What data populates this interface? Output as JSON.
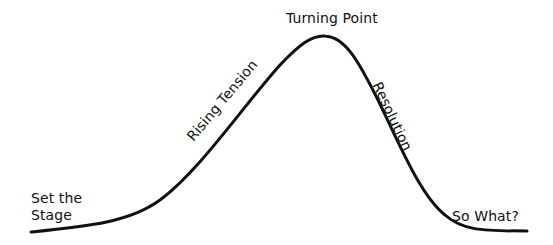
{
  "diagram": {
    "type": "story-arc",
    "stroke_color": "#111111",
    "background_color": "#ffffff",
    "labels": {
      "set_the_stage_line1": "Set the",
      "set_the_stage_line2": "Stage",
      "rising_tension": "Rising Tension",
      "turning_point": "Turning Point",
      "resolution": "Resolution",
      "so_what": "So What?"
    },
    "curve_path": "M31,232 C90,226 130,222 160,200 C200,170 240,110 280,65 C300,44 312,35 325,36 C345,37 358,60 378,100 C400,145 420,195 445,215 C462,230 480,231 527,231"
  }
}
